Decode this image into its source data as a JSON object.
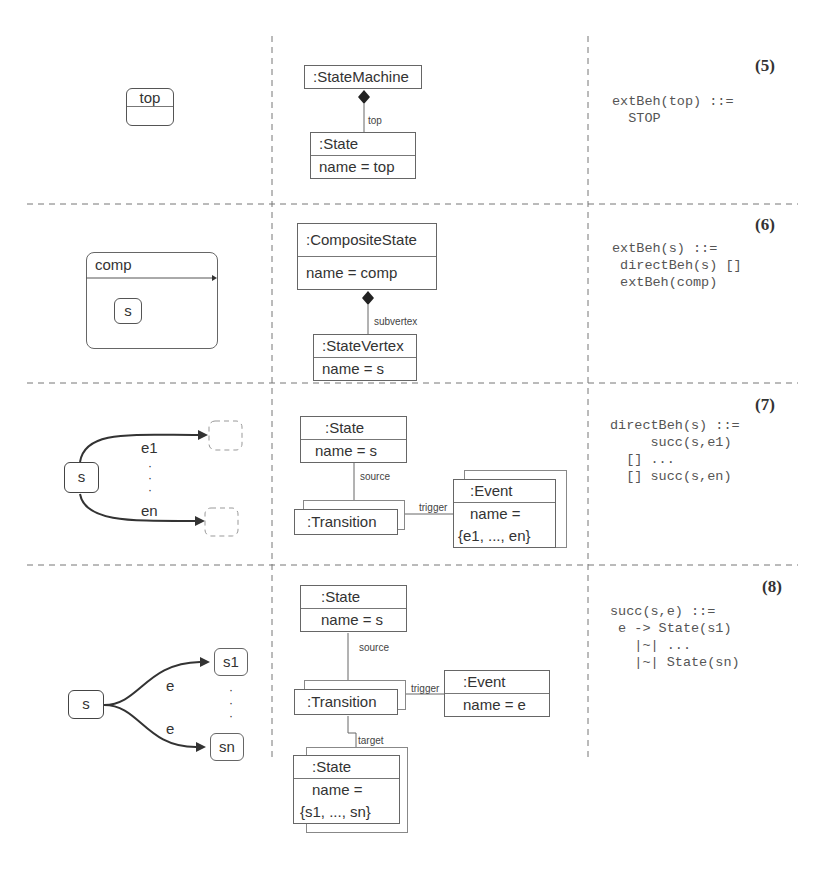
{
  "top_fragment": "rule, that the transition relations are correctly translated...",
  "rows": [
    {
      "number": "(5)",
      "statechart": {
        "state": "top"
      },
      "metamodel": {
        "container": ":StateMachine",
        "role": "top",
        "child_class": ":State",
        "child_attr": "name = top"
      },
      "code": [
        "extBeh(top) ::=",
        "  STOP"
      ]
    },
    {
      "number": "(6)",
      "statechart": {
        "composite": "comp",
        "substate": "s"
      },
      "metamodel": {
        "container_class": ":CompositeState",
        "container_attr": "name = comp",
        "role": "subvertex",
        "child_class": ":StateVertex",
        "child_attr": "name = s"
      },
      "code": [
        "extBeh(s) ::=",
        " directBeh(s) []",
        " extBeh(comp)"
      ]
    },
    {
      "number": "(7)",
      "statechart": {
        "source": "s",
        "event_first": "e1",
        "event_last": "en",
        "ellipsis": "·\n·\n·"
      },
      "metamodel": {
        "state_class": ":State",
        "state_attr": "name = s",
        "source_role": "source",
        "transition": ":Transition",
        "trigger_role": "trigger",
        "event_class": ":Event",
        "event_attr_line1": "name =",
        "event_attr_line2": "{e1, ..., en}"
      },
      "code": [
        "directBeh(s) ::=",
        "     succ(s,e1)",
        "  [] ...",
        "  [] succ(s,en)"
      ]
    },
    {
      "number": "(8)",
      "statechart": {
        "source": "s",
        "event": "e",
        "target_first": "s1",
        "target_last": "sn"
      },
      "metamodel": {
        "state_class": ":State",
        "state_attr": "name = s",
        "source_role": "source",
        "transition": ":Transition",
        "trigger_role": "trigger",
        "event_class": ":Event",
        "event_attr": "name = e",
        "target_role": "target",
        "target_class": ":State",
        "target_attr_line1": "name =",
        "target_attr_line2": "{s1, ..., sn}"
      },
      "code": [
        "succ(s,e) ::=",
        " e -> State(s1)",
        "   |~| ...",
        "   |~| State(sn)"
      ]
    }
  ]
}
